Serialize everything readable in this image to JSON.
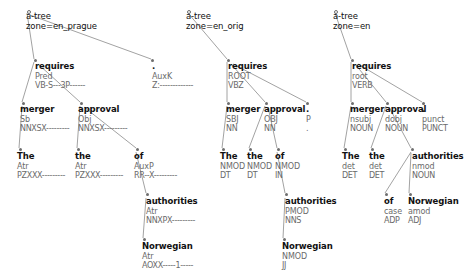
{
  "canvas": {
    "width": 471,
    "height": 278,
    "background": "#ffffff"
  },
  "style": {
    "edge_color": "#8a8a8a",
    "node_dot_color": "#6e6e6e",
    "word_color": "#111111",
    "label_color": "#6a6a6a"
  },
  "trees": [
    {
      "id": "tree-en-prague",
      "root": {
        "line1": "a-tree",
        "line2": "zone=en_prague",
        "x": 26,
        "y": 12,
        "dot_x": 27,
        "dot_y": 10
      },
      "nodes": [
        {
          "id": "prague-requires",
          "word": "requires",
          "afun": "Pred",
          "tag": "VB-S---3P------",
          "x": 35,
          "y": 62,
          "dot_x": 34,
          "dot_y": 59
        },
        {
          "id": "prague-auxk",
          "word": ".",
          "afun": "AuxK",
          "tag": "Z:-------------",
          "x": 152,
          "y": 62,
          "dot_x": 151,
          "dot_y": 59
        },
        {
          "id": "prague-merger",
          "word": "merger",
          "afun": "Sb",
          "tag": "NNXSX---------",
          "x": 20,
          "y": 105,
          "dot_x": 22,
          "dot_y": 102
        },
        {
          "id": "prague-approval",
          "word": "approval",
          "afun": "Obj",
          "tag": "NNXSX---------",
          "x": 78,
          "y": 105,
          "dot_x": 80,
          "dot_y": 102
        },
        {
          "id": "prague-the1",
          "word": "The",
          "afun": "Atr",
          "tag": "PZXXX---------",
          "x": 17,
          "y": 152,
          "dot_x": 19,
          "dot_y": 148
        },
        {
          "id": "prague-the2",
          "word": "the",
          "afun": "Atr",
          "tag": "PZXXX---------",
          "x": 75,
          "y": 152,
          "dot_x": 77,
          "dot_y": 148
        },
        {
          "id": "prague-of",
          "word": "of",
          "afun": "AuxP",
          "tag": "RR--X---------",
          "x": 134,
          "y": 152,
          "dot_x": 136,
          "dot_y": 148
        },
        {
          "id": "prague-authorities",
          "word": "authorities",
          "afun": "Atr",
          "tag": "NNXPX---------",
          "x": 146,
          "y": 197,
          "dot_x": 146,
          "dot_y": 193
        },
        {
          "id": "prague-norwegian",
          "word": "Norwegian",
          "afun": "Atr",
          "tag": "AOXX-----1-----",
          "x": 142,
          "y": 242,
          "dot_x": 143,
          "dot_y": 238
        }
      ],
      "edges": [
        {
          "from": [
            27,
            13
          ],
          "to": [
            34,
            59
          ]
        },
        {
          "from": [
            30,
            15
          ],
          "to": [
            151,
            59
          ]
        },
        {
          "from": [
            34,
            62
          ],
          "to": [
            22,
            102
          ]
        },
        {
          "from": [
            38,
            64
          ],
          "to": [
            80,
            102
          ]
        },
        {
          "from": [
            22,
            106
          ],
          "to": [
            19,
            148
          ]
        },
        {
          "from": [
            80,
            106
          ],
          "to": [
            77,
            148
          ]
        },
        {
          "from": [
            84,
            107
          ],
          "to": [
            136,
            148
          ]
        },
        {
          "from": [
            136,
            152
          ],
          "to": [
            146,
            193
          ]
        },
        {
          "from": [
            146,
            198
          ],
          "to": [
            143,
            238
          ]
        }
      ]
    },
    {
      "id": "tree-en-orig",
      "root": {
        "line1": "a-tree",
        "line2": "zone=en_orig",
        "x": 186,
        "y": 12,
        "dot_x": 187,
        "dot_y": 10
      },
      "nodes": [
        {
          "id": "orig-requires",
          "word": "requires",
          "afun": "ROOT",
          "tag": "VBZ",
          "x": 228,
          "y": 62,
          "dot_x": 227,
          "dot_y": 59
        },
        {
          "id": "orig-merger",
          "word": "merger",
          "afun": "SBJ",
          "tag": "NN",
          "x": 226,
          "y": 105,
          "dot_x": 227,
          "dot_y": 102
        },
        {
          "id": "orig-approval",
          "word": "approval",
          "afun": "OBJ",
          "tag": "NN",
          "x": 264,
          "y": 105,
          "dot_x": 265,
          "dot_y": 102
        },
        {
          "id": "orig-punct",
          "word": ".",
          "afun": "P",
          "tag": ".",
          "x": 306,
          "y": 105,
          "dot_x": 306,
          "dot_y": 102
        },
        {
          "id": "orig-the1",
          "word": "The",
          "afun": "NMOD",
          "tag": "DT",
          "x": 220,
          "y": 152,
          "dot_x": 222,
          "dot_y": 148
        },
        {
          "id": "orig-the2",
          "word": "the",
          "afun": "NMOD",
          "tag": "DT",
          "x": 247,
          "y": 152,
          "dot_x": 249,
          "dot_y": 148
        },
        {
          "id": "orig-of",
          "word": "of",
          "afun": "NMOD",
          "tag": "IN",
          "x": 275,
          "y": 152,
          "dot_x": 277,
          "dot_y": 148
        },
        {
          "id": "orig-authorities",
          "word": "authorities",
          "afun": "PMOD",
          "tag": "NNS",
          "x": 285,
          "y": 197,
          "dot_x": 285,
          "dot_y": 193
        },
        {
          "id": "orig-norwegian",
          "word": "Norwegian",
          "afun": "NMOD",
          "tag": "JJ",
          "x": 282,
          "y": 242,
          "dot_x": 283,
          "dot_y": 238
        }
      ],
      "edges": [
        {
          "from": [
            188,
            13
          ],
          "to": [
            227,
            59
          ]
        },
        {
          "from": [
            227,
            62
          ],
          "to": [
            227,
            102
          ]
        },
        {
          "from": [
            231,
            64
          ],
          "to": [
            265,
            102
          ]
        },
        {
          "from": [
            233,
            64
          ],
          "to": [
            306,
            102
          ]
        },
        {
          "from": [
            227,
            106
          ],
          "to": [
            222,
            148
          ]
        },
        {
          "from": [
            265,
            106
          ],
          "to": [
            249,
            148
          ]
        },
        {
          "from": [
            268,
            107
          ],
          "to": [
            277,
            148
          ]
        },
        {
          "from": [
            277,
            152
          ],
          "to": [
            285,
            193
          ]
        },
        {
          "from": [
            285,
            198
          ],
          "to": [
            283,
            238
          ]
        }
      ]
    },
    {
      "id": "tree-en",
      "root": {
        "line1": "a-tree",
        "line2": "zone=en",
        "x": 333,
        "y": 12,
        "dot_x": 334,
        "dot_y": 10
      },
      "nodes": [
        {
          "id": "en-requires",
          "word": "requires",
          "afun": "root",
          "tag": "VERB",
          "x": 352,
          "y": 62,
          "dot_x": 351,
          "dot_y": 59
        },
        {
          "id": "en-merger",
          "word": "merger",
          "afun": "nsubj",
          "tag": "NOUN",
          "x": 350,
          "y": 105,
          "dot_x": 351,
          "dot_y": 102
        },
        {
          "id": "en-approval",
          "word": "approval",
          "afun": "dobj",
          "tag": "NOUN",
          "x": 385,
          "y": 105,
          "dot_x": 386,
          "dot_y": 102
        },
        {
          "id": "en-punct",
          "word": ".",
          "afun": "punct",
          "tag": "PUNCT",
          "x": 422,
          "y": 105,
          "dot_x": 422,
          "dot_y": 102
        },
        {
          "id": "en-the1",
          "word": "The",
          "afun": "det",
          "tag": "DET",
          "x": 342,
          "y": 152,
          "dot_x": 344,
          "dot_y": 148
        },
        {
          "id": "en-the2",
          "word": "the",
          "afun": "det",
          "tag": "DET",
          "x": 369,
          "y": 152,
          "dot_x": 371,
          "dot_y": 148
        },
        {
          "id": "en-authorities",
          "word": "authorities",
          "afun": "nmod",
          "tag": "NOUN",
          "x": 412,
          "y": 152,
          "dot_x": 411,
          "dot_y": 148
        },
        {
          "id": "en-of",
          "word": "of",
          "afun": "case",
          "tag": "ADP",
          "x": 384,
          "y": 197,
          "dot_x": 385,
          "dot_y": 193
        },
        {
          "id": "en-norwegian",
          "word": "Norwegian",
          "afun": "amod",
          "tag": "ADJ",
          "x": 408,
          "y": 197,
          "dot_x": 409,
          "dot_y": 193
        }
      ],
      "edges": [
        {
          "from": [
            335,
            13
          ],
          "to": [
            351,
            59
          ]
        },
        {
          "from": [
            351,
            62
          ],
          "to": [
            351,
            102
          ]
        },
        {
          "from": [
            355,
            64
          ],
          "to": [
            386,
            102
          ]
        },
        {
          "from": [
            358,
            64
          ],
          "to": [
            422,
            102
          ]
        },
        {
          "from": [
            351,
            106
          ],
          "to": [
            344,
            148
          ]
        },
        {
          "from": [
            386,
            106
          ],
          "to": [
            371,
            148
          ]
        },
        {
          "from": [
            389,
            107
          ],
          "to": [
            411,
            148
          ]
        },
        {
          "from": [
            411,
            152
          ],
          "to": [
            385,
            193
          ]
        },
        {
          "from": [
            411,
            153
          ],
          "to": [
            409,
            193
          ]
        }
      ]
    }
  ]
}
